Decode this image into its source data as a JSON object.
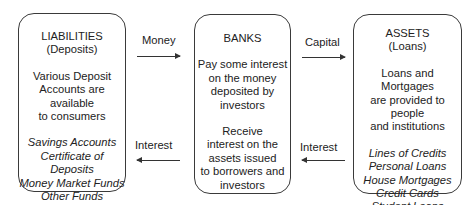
{
  "liabilities": {
    "title": "LIABILITIES",
    "subtitle": "(Deposits)",
    "description": [
      "Various Deposit",
      "Accounts are available",
      "to consumers"
    ],
    "items": [
      "Savings Accounts",
      "Certificate of Deposits",
      "Money Market Funds",
      "Other Funds"
    ],
    "ellipsis": "..."
  },
  "banks": {
    "title": "BANKS",
    "pay": [
      "Pay some interest",
      "on the money",
      "deposited by",
      "investors"
    ],
    "receive": [
      "Receive",
      "interest on the",
      "assets issued",
      "to borrowers and",
      "investors"
    ]
  },
  "assets": {
    "title": "ASSETS",
    "subtitle": "(Loans)",
    "description": [
      "Loans and Mortgages",
      "are provided to people",
      "and institutions"
    ],
    "items": [
      "Lines of Credits",
      "Personal Loans",
      "House Mortgages",
      "Credit Cards",
      "Student Loans"
    ],
    "ellipsis": "..."
  },
  "arrows": {
    "money": "Money",
    "capital": "Capital",
    "interest_left": "Interest",
    "interest_right": "Interest"
  }
}
